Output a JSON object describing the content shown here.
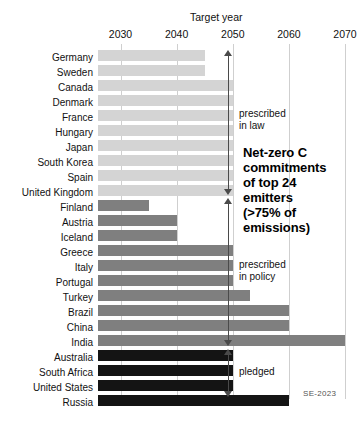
{
  "chart_data": {
    "type": "bar",
    "orientation": "horizontal",
    "title": "Net-zero C commitments of top 24 emitters (>75% of emissions)",
    "xlabel": "Target year",
    "ylabel": "",
    "xlim": [
      2026,
      2072
    ],
    "grid": true,
    "ticks": [
      2030,
      2040,
      2050,
      2060,
      2070
    ],
    "tick_labels": [
      "2030",
      "2040",
      "2050",
      "2060",
      "2070"
    ],
    "baseline": 2026,
    "categories": [
      "Germany",
      "Sweden",
      "Canada",
      "Denmark",
      "France",
      "Hungary",
      "Japan",
      "South Korea",
      "Spain",
      "United Kingdom",
      "Finland",
      "Austria",
      "Iceland",
      "Greece",
      "Italy",
      "Portugal",
      "Turkey",
      "Brazil",
      "China",
      "India",
      "Australia",
      "South Africa",
      "United States",
      "Russia"
    ],
    "values": [
      2045,
      2045,
      2050,
      2050,
      2050,
      2050,
      2050,
      2050,
      2050,
      2050,
      2035,
      2040,
      2040,
      2050,
      2050,
      2050,
      2053,
      2060,
      2060,
      2070,
      2050,
      2050,
      2050,
      2060
    ],
    "groups": [
      {
        "name": "prescribed in law",
        "color": "#d4d4d4",
        "from": 0,
        "to": 9
      },
      {
        "name": "prescribed in policy",
        "color": "#7f7f7f",
        "from": 10,
        "to": 19
      },
      {
        "name": "pledged",
        "color": "#141414",
        "from": 20,
        "to": 23
      }
    ],
    "annotations": [
      {
        "id": "bracket-law",
        "text": "prescribed\nin law"
      },
      {
        "id": "bracket-policy",
        "text": "prescribed\nin policy"
      },
      {
        "id": "bracket-pledged",
        "text": "pledged"
      }
    ],
    "credit": "SE-2023"
  },
  "axis": {
    "title": "Target year",
    "ticks": [
      "2030",
      "2040",
      "2050",
      "2060",
      "2070"
    ]
  },
  "headline": {
    "text": "Net-zero C\ncommitments\nof top 24\nemitters\n(>75% of\nemissions)"
  },
  "brackets": {
    "law": "prescribed\nin law",
    "policy": "prescribed\nin policy",
    "pledged": "pledged"
  },
  "credit": {
    "text": "SE-2023"
  },
  "colors": {
    "law": "#d4d4d4",
    "policy": "#7f7f7f",
    "pledged": "#141414",
    "grid": "#cfcfcf",
    "arrow": "#4a4a4a"
  }
}
